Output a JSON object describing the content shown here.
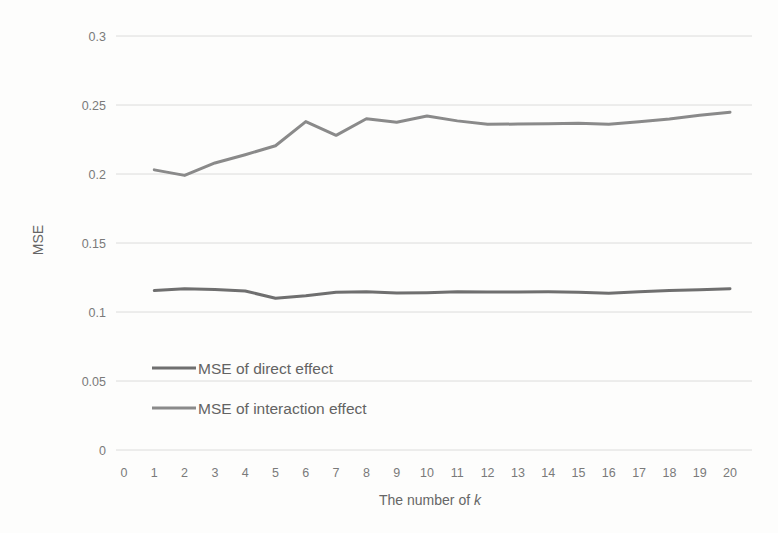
{
  "chart_data": {
    "type": "line",
    "title": "",
    "xlabel": "The number of k",
    "xlabel_plain": "The number of ",
    "xlabel_italic": "k",
    "ylabel": "MSE",
    "xlim": [
      0,
      20
    ],
    "ylim": [
      0,
      0.3
    ],
    "grid": true,
    "legend_position": "inside-lower-left",
    "x_tick_labels": [
      "0",
      "1",
      "2",
      "3",
      "4",
      "5",
      "6",
      "7",
      "8",
      "9",
      "10",
      "11",
      "12",
      "13",
      "14",
      "15",
      "16",
      "17",
      "18",
      "19",
      "20"
    ],
    "y_tick_labels": [
      "0",
      "0.05",
      "0.1",
      "0.15",
      "0.2",
      "0.25",
      "0.3"
    ],
    "y_tick_values": [
      0,
      0.05,
      0.1,
      0.15,
      0.2,
      0.25,
      0.3
    ],
    "x": [
      1,
      2,
      3,
      4,
      5,
      6,
      7,
      8,
      9,
      10,
      11,
      12,
      13,
      14,
      15,
      16,
      17,
      18,
      19,
      20
    ],
    "series": [
      {
        "name": "MSE of direct effect",
        "color": "#6f6f6f",
        "line_width": 3.0,
        "values": [
          0.1155,
          0.1168,
          0.1163,
          0.1152,
          0.11,
          0.1118,
          0.1143,
          0.1147,
          0.1137,
          0.114,
          0.1146,
          0.1145,
          0.1145,
          0.1146,
          0.1144,
          0.1136,
          0.1146,
          0.1155,
          0.1162,
          0.1168
        ]
      },
      {
        "name": "MSE of interaction effect",
        "color": "#8a8a8a",
        "line_width": 3.0,
        "values": [
          0.203,
          0.199,
          0.208,
          0.214,
          0.2205,
          0.238,
          0.228,
          0.24,
          0.2375,
          0.242,
          0.2385,
          0.236,
          0.2362,
          0.2365,
          0.2368,
          0.236,
          0.2378,
          0.2398,
          0.2425,
          0.2448
        ]
      }
    ],
    "legend_entries": [
      {
        "label": "MSE of direct effect",
        "color": "#6f6f6f"
      },
      {
        "label": "MSE of interaction effect",
        "color": "#8a8a8a"
      }
    ]
  }
}
